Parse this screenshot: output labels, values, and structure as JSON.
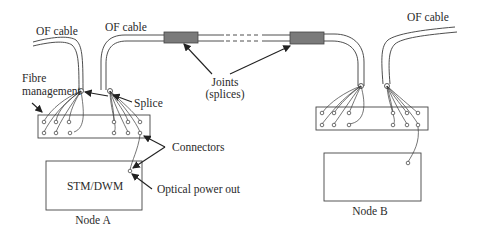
{
  "labels": {
    "of_cable_left": "OF cable",
    "of_cable_mid": "OF cable",
    "of_cable_right": "OF cable",
    "fibre_management_line1": "Fibre",
    "fibre_management_line2": "management",
    "splice": "Splice",
    "joints_line1": "Joints",
    "joints_line2": "(splices)",
    "connectors": "Connectors",
    "optical_power_out": "Optical power out",
    "equipment": "STM/DWM",
    "node_a": "Node A",
    "node_b": "Node B"
  },
  "colors": {
    "line": "#3a3a3a",
    "joint_fill": "#7a7a7a",
    "background": "#ffffff"
  }
}
